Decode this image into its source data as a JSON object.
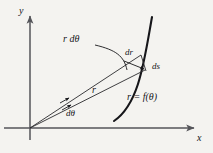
{
  "figure": {
    "background_color": "#f4f3f0",
    "ink_color": "#16161a",
    "axis_color": "#55555a",
    "width": 213,
    "height": 153
  },
  "axes": {
    "y_label": "y",
    "x_label": "x",
    "origin": {
      "x": 30,
      "y": 128
    },
    "y_axis": {
      "x": 30,
      "y_top": 14,
      "y_bottom": 140,
      "arrow": "up"
    },
    "x_axis": {
      "y": 128,
      "x_left": 4,
      "x_right": 196,
      "arrow": "right"
    }
  },
  "labels": {
    "r_dtheta": "r dθ",
    "dr": "dr",
    "ds": "ds",
    "r": "r",
    "dtheta": "dθ",
    "curve_equation": "r = f(θ)"
  },
  "geometry": {
    "ray_lower": {
      "x1": 30,
      "y1": 128,
      "x2": 143,
      "y2": 67
    },
    "ray_upper": {
      "x1": 30,
      "y1": 128,
      "x2": 140,
      "y2": 55
    },
    "curve": {
      "type": "polar-curve",
      "start": {
        "x": 114,
        "y": 121
      },
      "control1": {
        "x": 139,
        "y": 104
      },
      "control2": {
        "x": 144,
        "y": 62
      },
      "end": {
        "x": 152,
        "y": 17
      },
      "stroke_width": 2.1
    },
    "leader_r_dtheta": {
      "start": {
        "x": 95,
        "y": 45
      },
      "control": {
        "x": 116,
        "y": 52
      },
      "end": {
        "x": 126,
        "y": 70
      }
    },
    "dtheta_ticks": [
      {
        "x": 66,
        "y": 99,
        "angle": -28
      },
      {
        "x": 70,
        "y": 106,
        "angle": -28
      }
    ],
    "dr_arrow": {
      "x1": 126,
      "y1": 62,
      "x2": 145,
      "y2": 69
    },
    "ds_segment": {
      "x1": 140,
      "y1": 55,
      "x2": 145,
      "y2": 70
    }
  }
}
